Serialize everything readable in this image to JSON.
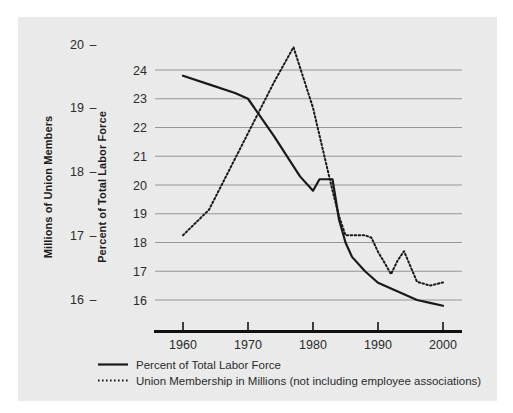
{
  "figure": {
    "background_color": "#eaeaea",
    "page_color": "#ffffff",
    "grid_color": "#8d8d8d",
    "axis_color": "#111111",
    "series_color": "#1a1a1a"
  },
  "left_axis": {
    "title": "Millions of Union Members",
    "ticks": [
      "20",
      "19",
      "18",
      "17",
      "16"
    ],
    "values": [
      20,
      19,
      18,
      17,
      16
    ],
    "tick_marker": "–"
  },
  "right_axis": {
    "title": "Percent of Total Labor Force",
    "ticks": [
      "24",
      "23",
      "22",
      "21",
      "20",
      "19",
      "18",
      "17",
      "16"
    ],
    "values": [
      24,
      23,
      22,
      21,
      20,
      19,
      18,
      17,
      16
    ]
  },
  "x_axis": {
    "ticks": [
      "1960",
      "1970",
      "1980",
      "1990",
      "2000"
    ],
    "values": [
      1960,
      1970,
      1980,
      1990,
      2000
    ]
  },
  "legend": {
    "items": [
      {
        "label": "Percent of Total Labor Force",
        "style": "solid",
        "marker": "solid-line-swatch"
      },
      {
        "label": "Union Membership in Millions (not including employee associations)",
        "style": "dotted",
        "marker": "dotted-line-swatch"
      }
    ]
  },
  "chart_data": {
    "type": "line",
    "title": "",
    "xlabel": "",
    "ylabel": "Millions of Union Members",
    "ylabel_secondary": "Percent of Total Labor Force",
    "xlim": [
      1958,
      2001
    ],
    "ylim_left": [
      15.6,
      20.2
    ],
    "ylim_right": [
      15.6,
      24.6
    ],
    "grid": true,
    "grid_axis": "y",
    "legend_position": "below",
    "series": [
      {
        "name": "Percent of Total Labor Force",
        "axis": "right",
        "style": "solid",
        "units": "percent",
        "x": [
          1960,
          1964,
          1968,
          1970,
          1974,
          1978,
          1980,
          1981,
          1983,
          1984,
          1985,
          1986,
          1988,
          1990,
          1992,
          1994,
          1996,
          1998,
          2000
        ],
        "values": [
          23.8,
          23.5,
          23.2,
          23.0,
          21.7,
          20.3,
          19.8,
          20.2,
          20.2,
          18.8,
          18.0,
          17.5,
          17.0,
          16.6,
          16.4,
          16.2,
          16.0,
          15.9,
          15.8
        ]
      },
      {
        "name": "Union Membership in Millions (not including employee associations)",
        "axis": "left",
        "style": "dotted",
        "units": "millions",
        "x": [
          1960,
          1964,
          1968,
          1970,
          1974,
          1977,
          1980,
          1983,
          1984,
          1985,
          1986,
          1988,
          1989,
          1990,
          1991,
          1992,
          1993,
          1994,
          1996,
          1998,
          2000
        ],
        "values": [
          17.0,
          17.4,
          18.2,
          18.6,
          19.4,
          19.95,
          19.0,
          17.7,
          17.3,
          17.0,
          17.0,
          17.0,
          16.96,
          16.74,
          16.57,
          16.39,
          16.6,
          16.75,
          16.27,
          16.21,
          16.26
        ]
      }
    ]
  }
}
